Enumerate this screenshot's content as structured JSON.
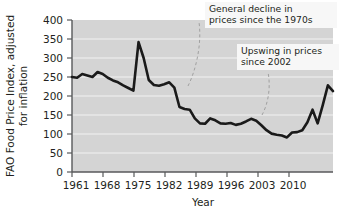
{
  "chart_data": {
    "type": "line",
    "title": "",
    "subtitle": "",
    "xlabel": "Year",
    "ylabel": "FAO Food Price Index, adjusted for inflation",
    "ylabel_line1": "FAO Food Price Index, adjusted",
    "ylabel_line2": "for inflation",
    "xlim": [
      1961,
      2012
    ],
    "ylim": [
      0,
      400
    ],
    "yticks": [
      0,
      50,
      100,
      150,
      200,
      250,
      300,
      350,
      400
    ],
    "ytick_labels": [
      "0",
      "50",
      "100",
      "150",
      "200",
      "250",
      "300",
      "350",
      "400"
    ],
    "xticks": [
      1961,
      1968,
      1975,
      1982,
      1989,
      1996,
      2003,
      2010
    ],
    "xtick_labels": [
      "1961",
      "1968",
      "1975",
      "1982",
      "1989",
      "1996",
      "2003",
      "2010"
    ],
    "grid": "horizontal",
    "plot_background": "#d4d4d4",
    "gridline_color": "#f0f0f0",
    "line_color": "#1a1a1a",
    "legend": "none",
    "legend_position": "none",
    "series": [
      {
        "name": "FAO Food Price Index (real)",
        "x": [
          1961,
          1962,
          1963,
          1964,
          1965,
          1966,
          1967,
          1968,
          1969,
          1970,
          1971,
          1972,
          1973,
          1974,
          1975,
          1976,
          1977,
          1978,
          1979,
          1980,
          1981,
          1982,
          1983,
          1984,
          1985,
          1986,
          1987,
          1988,
          1989,
          1990,
          1991,
          1992,
          1993,
          1994,
          1995,
          1996,
          1997,
          1998,
          1999,
          2000,
          2001,
          2002,
          2003,
          2004,
          2005,
          2006,
          2007,
          2008,
          2009,
          2010,
          2011,
          2012
        ],
        "values": [
          250,
          248,
          258,
          254,
          250,
          263,
          258,
          248,
          241,
          236,
          228,
          221,
          214,
          342,
          300,
          242,
          229,
          227,
          231,
          236,
          222,
          171,
          166,
          164,
          141,
          128,
          127,
          141,
          136,
          128,
          127,
          129,
          124,
          127,
          133,
          140,
          135,
          123,
          110,
          101,
          98,
          96,
          91,
          104,
          105,
          110,
          131,
          164,
          128,
          176,
          228,
          213
        ]
      }
    ],
    "annotations": [
      {
        "id": "annotation-decline",
        "line1": "General decline in",
        "line2": "prices since the 1970s",
        "leader": "dashed-curve"
      },
      {
        "id": "annotation-upswing",
        "line1": "Upswing in prices",
        "line2": "since 2002",
        "leader": "dashed-curve"
      }
    ]
  }
}
